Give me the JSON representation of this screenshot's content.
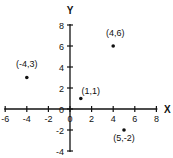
{
  "chart_data": {
    "type": "scatter",
    "title": "",
    "xlabel": "X",
    "ylabel": "Y",
    "xlim": [
      -6,
      8
    ],
    "ylim": [
      -4,
      8
    ],
    "x_ticks": [
      -6,
      -4,
      -2,
      0,
      2,
      4,
      6,
      8
    ],
    "y_ticks": [
      -4,
      -2,
      0,
      2,
      4,
      6,
      8
    ],
    "grid": false,
    "points": [
      {
        "x": -4,
        "y": 3,
        "label": "(-4,3)"
      },
      {
        "x": 4,
        "y": 6,
        "label": "(4,6)"
      },
      {
        "x": 1,
        "y": 1,
        "label": "(1,1)"
      },
      {
        "x": 5,
        "y": -2,
        "label": "(5,-2)"
      }
    ]
  }
}
